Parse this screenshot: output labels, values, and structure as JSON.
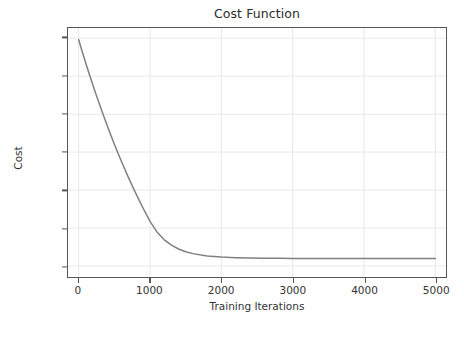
{
  "chart_data": {
    "type": "line",
    "title": "Cost Function",
    "xlabel": "Training Iterations",
    "ylabel": "Cost",
    "xlim": [
      -150,
      5150
    ],
    "ylim": [
      0.4855,
      0.8135
    ],
    "grid": true,
    "legend": null,
    "line_color": "#808080",
    "grid_color": "#e8e8e8",
    "axis_color": "#555555",
    "background": "#ffffff",
    "xticks": [
      0,
      1000,
      2000,
      3000,
      4000,
      5000
    ],
    "xtick_labels": [
      "0",
      "1000",
      "2000",
      "3000",
      "4000",
      "5000"
    ],
    "yticks": [
      0.5,
      0.55,
      0.6,
      0.65,
      0.7,
      0.75,
      0.8
    ],
    "ytick_labels": [
      "0.50",
      "0.55",
      "0.60",
      "0.65",
      "0.70",
      "0.75",
      "0.80"
    ],
    "series": [
      {
        "name": "Cost",
        "x": [
          0,
          50,
          100,
          150,
          200,
          250,
          300,
          350,
          400,
          450,
          500,
          550,
          600,
          650,
          700,
          750,
          800,
          850,
          900,
          950,
          1000,
          1100,
          1200,
          1300,
          1400,
          1500,
          1600,
          1800,
          2000,
          2200,
          2400,
          2600,
          2800,
          3000,
          3200,
          3400,
          3600,
          3800,
          4000,
          4200,
          4400,
          4600,
          4800,
          5000
        ],
        "y": [
          0.798,
          0.7823,
          0.7671,
          0.7523,
          0.738,
          0.7241,
          0.7106,
          0.6975,
          0.6848,
          0.6725,
          0.6605,
          0.6489,
          0.6376,
          0.6267,
          0.6161,
          0.6058,
          0.5958,
          0.5861,
          0.5767,
          0.5676,
          0.5587,
          0.5445,
          0.5345,
          0.5274,
          0.5224,
          0.5188,
          0.5163,
          0.5133,
          0.5118,
          0.5109,
          0.5104,
          0.5102,
          0.5101,
          0.51,
          0.51,
          0.5099,
          0.5099,
          0.5099,
          0.5099,
          0.5099,
          0.5099,
          0.5099,
          0.5099,
          0.5099
        ]
      }
    ]
  }
}
